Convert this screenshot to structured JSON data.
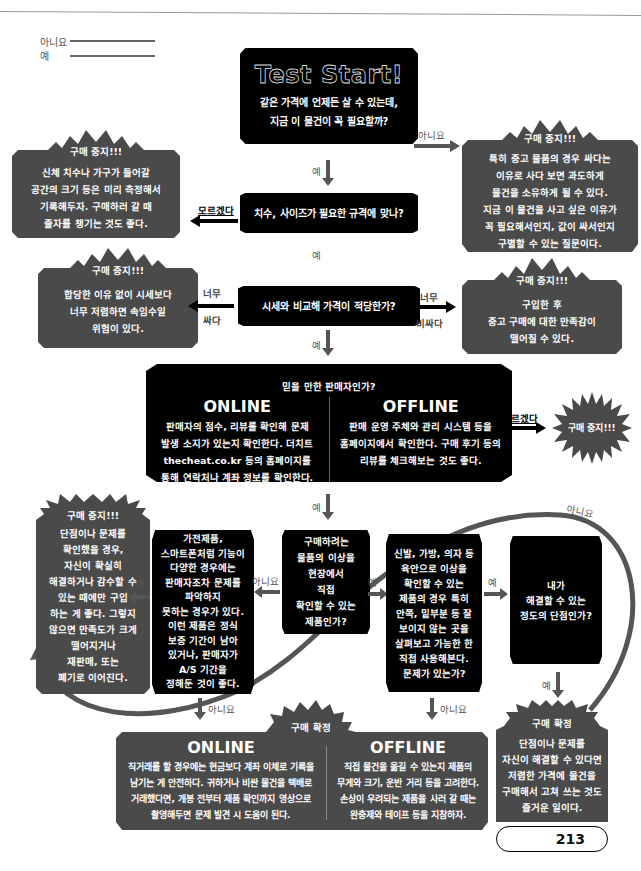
{
  "legend": {
    "no": "아니요",
    "yes": "예"
  },
  "start": {
    "title": "Test Start!",
    "question_line1": "같은 가격에 언제든 살 수 있는데,",
    "question_line2": "지금 이 물건이 꼭 필요할까?"
  },
  "labels": {
    "yes": "예",
    "no": "아니요",
    "dont_know": "모르겠다",
    "too_cheap_1": "너무",
    "too_cheap_2": "싸다",
    "too_expensive_1": "너무",
    "too_expensive_2": "비싸다"
  },
  "stop_title": "구매 중지!!!",
  "confirm_title": "구매 확정",
  "stop_need": {
    "lines": [
      "특히 중고 물품의 경우 싸다는",
      "이유로 사다 보면 과도하게",
      "물건을 소유하게 될 수 있다.",
      "지금 이 물건을 사고 싶은 이유가",
      "꼭 필요해서인지, 값이 싸서인지",
      "구별할 수 있는 질문이다."
    ]
  },
  "stop_size": {
    "lines": [
      "신체 치수나 가구가 들어갈",
      "공간의 크기 등은 미리 측정해서",
      "기록해두자. 구매하러 갈 때",
      "줄자를 챙기는 것도 좋다."
    ]
  },
  "q_size": "치수, 사이즈가 필요한 규격에 맞나?",
  "q_price": "시세와 비교해 가격이 적당한가?",
  "stop_cheap": {
    "lines": [
      "합당한 이유 없이 시세보다",
      "너무 저렴하면 속임수일",
      "위험이 있다."
    ]
  },
  "stop_expensive": {
    "lines": [
      "구입한 후",
      "중고 구매에 대한 만족감이",
      "떨어질 수 있다."
    ]
  },
  "q_seller": {
    "title": "믿을 만한 판매자인가?",
    "online_head": "ONLINE",
    "online_lines": [
      "판매자의 점수, 리뷰를 확인해 문제",
      "발생 소지가 있는지 확인한다. 더치트",
      "thecheat.co.kr 등의 홈페이지를",
      "통해 연락처나 계좌 정보를 확인한다."
    ],
    "offline_head": "OFFLINE",
    "offline_lines": [
      "판매 운영 주체와 관리 시스템 등을",
      "홈페이지에서 확인한다. 구매 후기 등의",
      "리뷰를 체크해보는 것도 좋다."
    ]
  },
  "q_inspect": {
    "lines": [
      "구매하려는",
      "물품의 이상을",
      "현장에서",
      "직접",
      "확인할 수 있는",
      "제품인가?"
    ]
  },
  "q_electronics": {
    "lines": [
      "가전제품,",
      "스마트폰처럼 기능이",
      "다양한 경우에는",
      "판매자조차 문제를",
      "파악하지",
      "못하는 경우가 있다.",
      "이런 제품은 정식",
      "보증 기간이 남아",
      "있거나, 판매자가",
      "A/S 기간을",
      "정해둔 것이 좋다."
    ]
  },
  "stop_defect": {
    "lines": [
      "단점이나 문제를",
      "확인했을 경우,",
      "자신이 확실히",
      "해결하거나 감수할 수",
      "있는 때에만 구입",
      "하는 게 좋다. 그렇지",
      "않으면 만족도가 크게",
      "떨어지거나",
      "재판매, 또는",
      "폐기로 이어진다."
    ]
  },
  "q_visual": {
    "lines": [
      "신발, 가방, 의자 등",
      "육안으로 이상을",
      "확인할 수 있는",
      "제품의 경우 특히",
      "안쪽, 밑부분 등 잘",
      "보이지 않는 곳을",
      "살펴보고 가능한 한",
      "직접 사용해본다.",
      "문제가 있는가?"
    ]
  },
  "q_fixable": {
    "lines": [
      "내가",
      "해결할 수 있는",
      "정도의 단점인가?"
    ]
  },
  "confirm_bottom": {
    "online_head": "ONLINE",
    "online_lines": [
      "직거래를 할 경우에는 현금보다 계좌 이체로 기록을",
      "남기는 게 안전하다. 귀하거나 비싼 물건을 택배로",
      "거래했다면, 개봉 전부터 제품 확인까지 영상으로",
      "촬영해두면 문제 발견 시 도움이 된다."
    ],
    "offline_head": "OFFLINE",
    "offline_lines": [
      "직접 물건을 옮길 수 있는지 제품의",
      "무게와 크기, 운반 거리 등을 고려한다.",
      "손상이 우려되는 제품을 사러 갈 때는",
      "완충제와 테이프 등을 지참하자."
    ]
  },
  "confirm_fix": {
    "lines": [
      "단점이나 문제를",
      "자신이 해결할 수 있다면",
      "저렴한 가격에 물건을",
      "구매해서 고쳐 쓰는 것도",
      "즐거운 일이다."
    ]
  },
  "page_number": "213",
  "colors": {
    "black_box": "#000000",
    "gray_box": "#4a4a4a",
    "arrow": "#555555"
  }
}
